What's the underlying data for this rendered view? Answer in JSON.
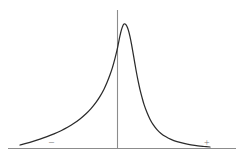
{
  "figure": {
    "title": "",
    "background_color": "#ffffff",
    "width": 244,
    "height": 160,
    "axis_color": "#8c8c8c",
    "curve_color": "#2b2b2b",
    "label_color": "#7a7a7a",
    "negative_sign": "–",
    "positive_sign": "+"
  },
  "chart_data": {
    "type": "line",
    "title": "",
    "subtitle": "",
    "xlabel": "",
    "ylabel": "",
    "annotations": [
      {
        "text": "–",
        "x": 54,
        "y": 142,
        "meaning": "negative-direction-marker"
      },
      {
        "text": "+",
        "x": 209,
        "y": 143,
        "meaning": "positive-direction-marker"
      }
    ],
    "legend": [],
    "legend_position": "none",
    "grid": false,
    "axis_lines": {
      "baseline": {
        "x1": 8,
        "y1": 148.5,
        "x2": 236,
        "y2": 148.5
      },
      "vertical_reference": {
        "x1": 117.5,
        "y1": 10,
        "x2": 117.5,
        "y2": 148.5
      }
    },
    "xlim": [
      0,
      244
    ],
    "ylim": [
      0,
      160
    ],
    "peak": {
      "x": 124,
      "y": 24
    },
    "series": [
      {
        "name": "distribution",
        "points": [
          [
            20,
            145.0
          ],
          [
            26,
            143.4
          ],
          [
            33,
            141.4
          ],
          [
            40,
            139.2
          ],
          [
            47,
            136.7
          ],
          [
            54,
            133.9
          ],
          [
            61,
            130.7
          ],
          [
            68,
            127.0
          ],
          [
            74,
            123.3
          ],
          [
            80,
            119.0
          ],
          [
            86,
            113.8
          ],
          [
            91,
            108.6
          ],
          [
            96,
            102.4
          ],
          [
            100,
            96.4
          ],
          [
            104,
            89.2
          ],
          [
            107,
            82.6
          ],
          [
            110,
            74.8
          ],
          [
            112.5,
            67.4
          ],
          [
            115,
            58.4
          ],
          [
            117,
            50.2
          ],
          [
            118.5,
            43.0
          ],
          [
            120,
            35.6
          ],
          [
            121.5,
            29.6
          ],
          [
            123,
            25.4
          ],
          [
            124,
            24.0
          ],
          [
            125.5,
            24.2
          ],
          [
            127,
            26.4
          ],
          [
            128.5,
            30.6
          ],
          [
            130,
            36.6
          ],
          [
            131.5,
            44.2
          ],
          [
            133,
            52.6
          ],
          [
            134.5,
            61.4
          ],
          [
            136,
            70.0
          ],
          [
            138,
            80.4
          ],
          [
            140,
            89.6
          ],
          [
            142,
            97.4
          ],
          [
            144,
            104.4
          ],
          [
            147,
            112.6
          ],
          [
            150,
            119.2
          ],
          [
            153,
            124.4
          ],
          [
            157,
            129.6
          ],
          [
            161,
            133.4
          ],
          [
            166,
            136.8
          ],
          [
            171,
            139.4
          ],
          [
            177,
            141.6
          ],
          [
            184,
            143.4
          ],
          [
            191,
            144.8
          ],
          [
            198,
            145.9
          ],
          [
            204,
            146.5
          ],
          [
            210,
            147.0
          ]
        ]
      }
    ]
  }
}
